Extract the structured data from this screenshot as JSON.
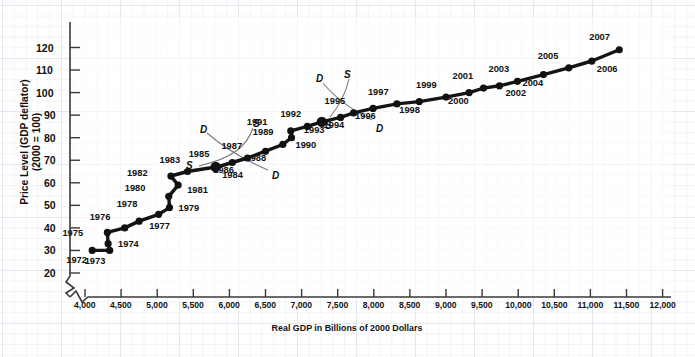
{
  "chart_data": {
    "type": "scatter",
    "title": "",
    "xlabel": "Real GDP in Billions of 2000 Dollars",
    "ylabel_line1": "Price Level (GDP deflator)",
    "ylabel_line2": "(2000 = 100)",
    "xlim": [
      3800,
      12000
    ],
    "ylim": [
      18,
      126
    ],
    "grid": true,
    "legend": "none",
    "axis_break": true,
    "x_ticks": [
      "4,000",
      "4,500",
      "5,000",
      "5,500",
      "6,000",
      "6,500",
      "7,000",
      "7,500",
      "8,000",
      "8,500",
      "9,000",
      "9,500",
      "10,000",
      "10,500",
      "11,000",
      "11,500",
      "12,000"
    ],
    "x_tick_values": [
      4000,
      4500,
      5000,
      5500,
      6000,
      6500,
      7000,
      7500,
      8000,
      8500,
      9000,
      9500,
      10000,
      10500,
      11000,
      11500,
      12000
    ],
    "y_ticks": [
      "20",
      "30",
      "40",
      "50",
      "60",
      "70",
      "80",
      "90",
      "100",
      "110",
      "120"
    ],
    "y_tick_values": [
      20,
      30,
      40,
      50,
      60,
      70,
      80,
      90,
      100,
      110,
      120
    ],
    "series_name": "U.S. Real GDP vs. Price Level, 1972-2007",
    "points": [
      {
        "label": "1972",
        "x": 4100,
        "y": 30,
        "lx": -11,
        "ly": 10
      },
      {
        "label": "1973",
        "x": 4342,
        "y": 30,
        "lx": -10,
        "ly": 11
      },
      {
        "label": "1974",
        "x": 4320,
        "y": 33,
        "lx": 6,
        "ly": 0
      },
      {
        "label": "1975",
        "x": 4310,
        "y": 38,
        "lx": -30,
        "ly": 1
      },
      {
        "label": "1976",
        "x": 4550,
        "y": 40,
        "lx": -20,
        "ly": -11
      },
      {
        "label": "1977",
        "x": 4750,
        "y": 43,
        "lx": 6,
        "ly": 5
      },
      {
        "label": "1978",
        "x": 5020,
        "y": 46,
        "lx": -27,
        "ly": -10
      },
      {
        "label": "1979",
        "x": 5170,
        "y": 49,
        "lx": 5,
        "ly": 0
      },
      {
        "label": "1980",
        "x": 5160,
        "y": 54,
        "lx": -29,
        "ly": -8
      },
      {
        "label": "1981",
        "x": 5290,
        "y": 59,
        "lx": 5,
        "ly": 5
      },
      {
        "label": "1982",
        "x": 5190,
        "y": 63,
        "lx": -29,
        "ly": -3
      },
      {
        "label": "1983",
        "x": 5420,
        "y": 65,
        "lx": -13,
        "ly": -12
      },
      {
        "label": "1985",
        "x": 5810,
        "y": 67,
        "lx": -12,
        "ly": -13
      },
      {
        "label": "1984",
        "x": 5830,
        "y": 67,
        "lx": 1,
        "ly": 8
      },
      {
        "label": "1986",
        "x": 6040,
        "y": 69,
        "lx": -4,
        "ly": 7
      },
      {
        "label": "1987",
        "x": 6250,
        "y": 71,
        "lx": -11,
        "ly": -12
      },
      {
        "label": "1988",
        "x": 6500,
        "y": 74,
        "lx": -5,
        "ly": 7
      },
      {
        "label": "1989",
        "x": 6740,
        "y": 77,
        "lx": -15,
        "ly": -12
      },
      {
        "label": "1990",
        "x": 6860,
        "y": 80,
        "lx": 0,
        "ly": 7
      },
      {
        "label": "1991",
        "x": 6850,
        "y": 83,
        "lx": -29,
        "ly": -9
      },
      {
        "label": "1992",
        "x": 7080,
        "y": 85,
        "lx": -12,
        "ly": -12
      },
      {
        "label": "1993",
        "x": 7280,
        "y": 87,
        "lx": -3,
        "ly": 8
      },
      {
        "label": "1994",
        "x": 7540,
        "y": 89,
        "lx": -2,
        "ly": 8
      },
      {
        "label": "1995",
        "x": 7720,
        "y": 91,
        "lx": -14,
        "ly": -12
      },
      {
        "label": "1996",
        "x": 7990,
        "y": 93,
        "lx": -3,
        "ly": 8
      },
      {
        "label": "1997",
        "x": 8320,
        "y": 95,
        "lx": -14,
        "ly": -12
      },
      {
        "label": "1998",
        "x": 8630,
        "y": 96,
        "lx": -5,
        "ly": 8
      },
      {
        "label": "1999",
        "x": 9000,
        "y": 98,
        "lx": -15,
        "ly": -12
      },
      {
        "label": "2000",
        "x": 9320,
        "y": 100,
        "lx": -6,
        "ly": 8
      },
      {
        "label": "2001",
        "x": 9520,
        "y": 102,
        "lx": -16,
        "ly": -12
      },
      {
        "label": "2002",
        "x": 9740,
        "y": 103,
        "lx": 2,
        "ly": 7
      },
      {
        "label": "2003",
        "x": 9990,
        "y": 105,
        "lx": -14,
        "ly": -12
      },
      {
        "label": "2004",
        "x": 10350,
        "y": 108,
        "lx": -6,
        "ly": 8
      },
      {
        "label": "2005",
        "x": 10700,
        "y": 111,
        "lx": -16,
        "ly": -12
      },
      {
        "label": "2006",
        "x": 11020,
        "y": 114,
        "lx": 1,
        "ly": 8
      },
      {
        "label": "2007",
        "x": 11400,
        "y": 119,
        "lx": -15,
        "ly": -13
      }
    ],
    "annotations": [
      {
        "text": "D",
        "x": 200,
        "y": 124,
        "name": "demand-curve-label-1985-left"
      },
      {
        "text": "S",
        "x": 253,
        "y": 118,
        "name": "supply-curve-label-1985-upper"
      },
      {
        "text": "S",
        "x": 186,
        "y": 160,
        "name": "supply-curve-label-1985-lower"
      },
      {
        "text": "D",
        "x": 272,
        "y": 170,
        "name": "demand-curve-label-1985-right"
      },
      {
        "text": "D",
        "x": 316,
        "y": 73,
        "name": "demand-curve-label-1993-left"
      },
      {
        "text": "S",
        "x": 344,
        "y": 69,
        "name": "supply-curve-label-1993-upper"
      },
      {
        "text": "S",
        "x": 325,
        "y": 120,
        "name": "supply-curve-label-1993-lower"
      },
      {
        "text": "D",
        "x": 376,
        "y": 123,
        "name": "demand-curve-label-1993-right"
      }
    ]
  },
  "xtitle": "Real GDP in Billions of 2000 Dollars",
  "ytitle_line1": "Price Level (GDP deflator)",
  "ytitle_line2": "(2000 = 100)"
}
